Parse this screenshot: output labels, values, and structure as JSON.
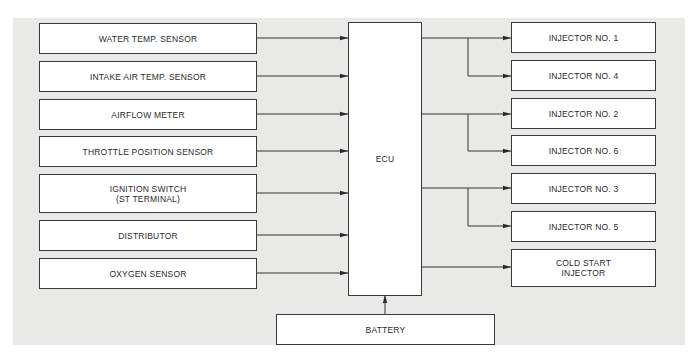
{
  "diagram": {
    "ecu": {
      "label": "ECU"
    },
    "inputs": [
      {
        "label": "WATER TEMP. SENSOR"
      },
      {
        "label": "INTAKE AIR TEMP. SENSOR"
      },
      {
        "label": "AIRFLOW METER"
      },
      {
        "label": "THROTTLE POSITION SENSOR"
      },
      {
        "label": "IGNITION SWITCH",
        "sub": "(ST TERMINAL)"
      },
      {
        "label": "DISTRIBUTOR"
      },
      {
        "label": "OXYGEN SENSOR"
      }
    ],
    "outputs": [
      {
        "label": "INJECTOR NO. 1"
      },
      {
        "label": "INJECTOR NO. 4"
      },
      {
        "label": "INJECTOR NO. 2"
      },
      {
        "label": "INJECTOR NO. 6"
      },
      {
        "label": "INJECTOR NO. 3"
      },
      {
        "label": "INJECTOR NO. 5"
      },
      {
        "label": "COLD START",
        "sub": "INJECTOR"
      }
    ],
    "power": {
      "label": "BATTERY"
    }
  }
}
